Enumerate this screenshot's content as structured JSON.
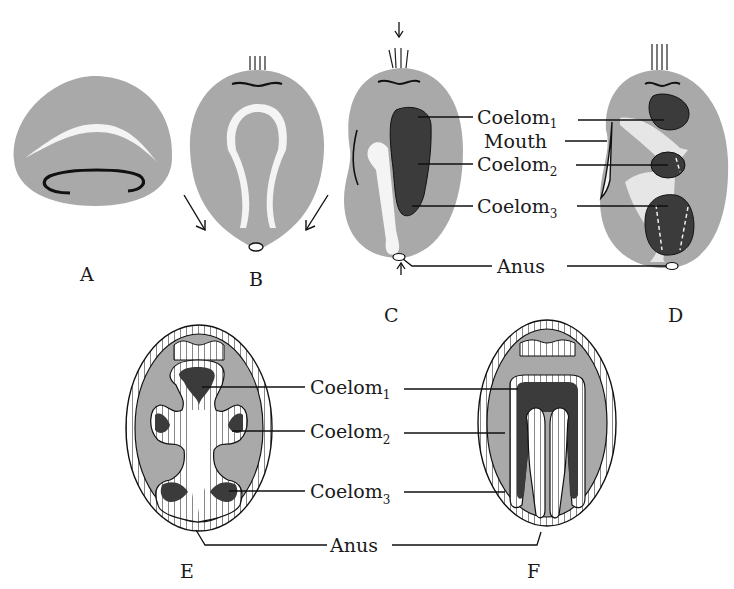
{
  "figure": {
    "type": "embryology diagram",
    "colors": {
      "body_gray": "#a9a9a9",
      "coelom_dark": "#3b3b3b",
      "gut_white": "#f4f4f4",
      "outline": "#111111"
    }
  },
  "panels": [
    {
      "id": "A",
      "label": "A"
    },
    {
      "id": "B",
      "label": "B"
    },
    {
      "id": "C",
      "label": "C"
    },
    {
      "id": "D",
      "label": "D"
    },
    {
      "id": "E",
      "label": "E"
    },
    {
      "id": "F",
      "label": "F"
    }
  ],
  "labels_top": {
    "coelom1": {
      "base": "Coelom",
      "sub": "1"
    },
    "mouth": "Mouth",
    "coelom2": {
      "base": "Coelom",
      "sub": "2"
    },
    "coelom3": {
      "base": "Coelom",
      "sub": "3"
    },
    "anus": "Anus"
  },
  "labels_bottom": {
    "coelom1": {
      "base": "Coelom",
      "sub": "1"
    },
    "coelom2": {
      "base": "Coelom",
      "sub": "2"
    },
    "coelom3": {
      "base": "Coelom",
      "sub": "3"
    },
    "anus": "Anus"
  }
}
